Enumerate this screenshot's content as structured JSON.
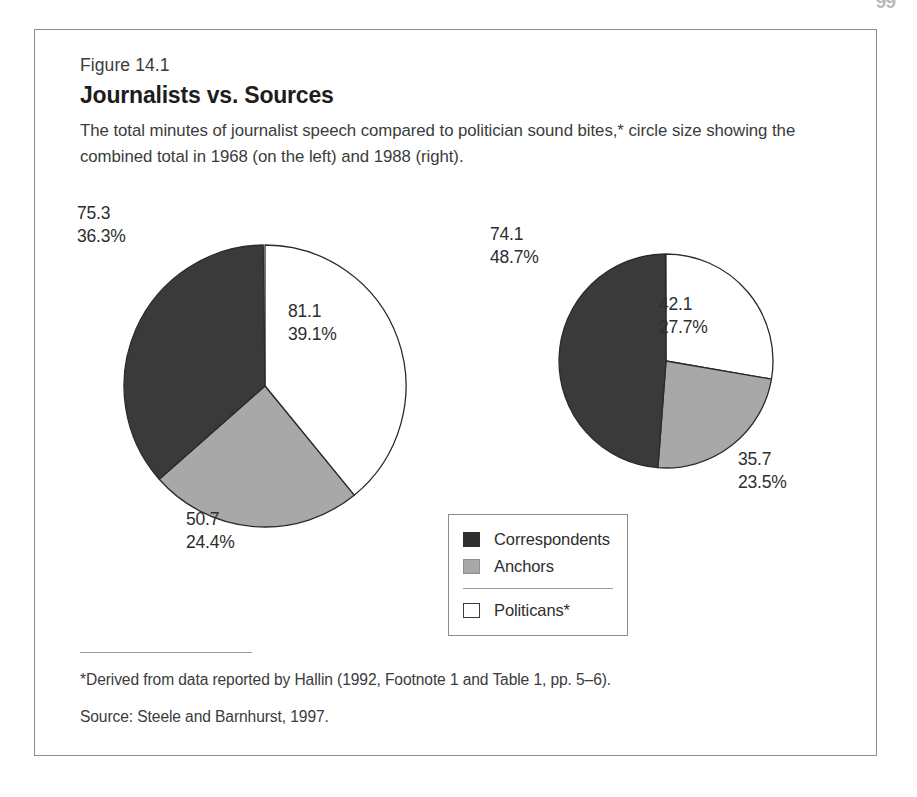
{
  "page": {
    "page_number_artifact": "99"
  },
  "figure": {
    "number_label": "Figure 14.1",
    "title": "Journalists vs. Sources",
    "description": "The total minutes of journalist speech compared to politician sound bites,* circle size showing the combined total in 1968 (on the left) and 1988 (right)."
  },
  "legend": {
    "items": [
      {
        "label": "Correspondents",
        "swatch": "dark-square-swatch",
        "color": "#2f2f2f"
      },
      {
        "label": "Anchors",
        "swatch": "gray-square-swatch",
        "color": "#a8a8a8"
      },
      {
        "label": "Politicans*",
        "swatch": "white-square-swatch",
        "color": "#ffffff"
      }
    ]
  },
  "notes": {
    "footnote": "*Derived from data reported by Hallin (1992, Footnote 1 and Table 1, pp. 5–6).",
    "source": "Source: Steele and Barnhurst, 1997."
  },
  "labels": {
    "left": {
      "dark": "75.3\n36.3%",
      "white": "81.1\n39.1%",
      "gray": "50.7\n24.4%"
    },
    "right": {
      "dark": "74.1\n48.7%",
      "white": "42.1\n27.7%",
      "gray": "35.7\n23.5%"
    }
  },
  "chart_data": {
    "type": "pie",
    "title": "Journalists vs. Sources",
    "subtitle": "The total minutes of journalist speech compared to politician sound bites,* circle size showing the combined total in 1968 (on the left) and 1988 (right).",
    "legend_position": "center-bottom-between-pies",
    "grid": false,
    "note": "Circle area encodes the combined total minutes; 1968 pie is larger than 1988 pie.",
    "charts": [
      {
        "name": "1968",
        "year": 1968,
        "position": "left",
        "total_minutes": 207.1,
        "radius_px": 141,
        "start_angle_deg": 0,
        "direction": "clockwise",
        "categories": [
          "Politicans*",
          "Anchors",
          "Correspondents"
        ],
        "values": [
          81.1,
          50.7,
          75.3
        ],
        "percents": [
          39.1,
          24.4,
          36.3
        ],
        "colors": [
          "#ffffff",
          "#a8a8a8",
          "#3a3a3a"
        ]
      },
      {
        "name": "1988",
        "year": 1988,
        "position": "right",
        "total_minutes": 151.9,
        "radius_px": 107,
        "start_angle_deg": 0,
        "direction": "clockwise",
        "categories": [
          "Politicans*",
          "Anchors",
          "Correspondents"
        ],
        "values": [
          42.1,
          35.7,
          74.1
        ],
        "percents": [
          27.7,
          23.5,
          48.7
        ],
        "colors": [
          "#ffffff",
          "#a8a8a8",
          "#3a3a3a"
        ]
      }
    ]
  }
}
